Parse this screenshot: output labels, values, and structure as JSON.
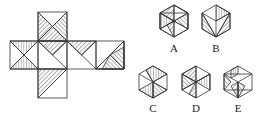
{
  "figure": {
    "type": "cube-net-puzzle",
    "net": {
      "faces": [
        {
          "id": "top",
          "x": 38,
          "y": 12,
          "shading": "upper-x-triangles"
        },
        {
          "id": "left",
          "x": 10,
          "y": 41,
          "shading": "x-top-bottom"
        },
        {
          "id": "center",
          "x": 38,
          "y": 41,
          "shading": "left-top-triangle"
        },
        {
          "id": "right1",
          "x": 67,
          "y": 41,
          "shading": "top-right-triangle"
        },
        {
          "id": "right2",
          "x": 96,
          "y": 41,
          "shading": "bottom-right-triangle"
        },
        {
          "id": "bottom",
          "x": 38,
          "y": 69,
          "shading": "lower-left-triangle"
        }
      ],
      "face_size": 29
    },
    "options": [
      {
        "label": "A",
        "cx": 174,
        "cy": 21
      },
      {
        "label": "B",
        "cx": 216,
        "cy": 21
      },
      {
        "label": "C",
        "cx": 153,
        "cy": 82
      },
      {
        "label": "D",
        "cx": 196,
        "cy": 82
      },
      {
        "label": "E",
        "cx": 238,
        "cy": 82
      }
    ],
    "stroke_color": "#333333",
    "background": "#ffffff"
  }
}
